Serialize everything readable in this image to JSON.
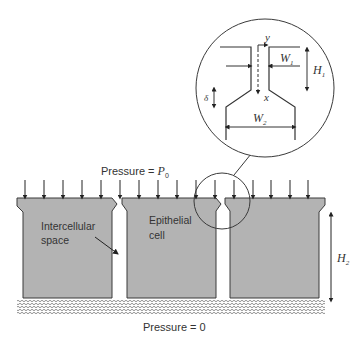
{
  "diagram": {
    "top_pressure": {
      "prefix": "Pressure = ",
      "symbol": "P",
      "subscript": "0"
    },
    "bottom_pressure": "Pressure = 0",
    "intercellular_label": [
      "Intercellular",
      "space"
    ],
    "epithelial_label": [
      "Epithelial",
      "cell"
    ],
    "h2_label": {
      "symbol": "H",
      "subscript": "2"
    },
    "inset": {
      "y_axis": "y",
      "x_axis": "x",
      "w1": {
        "symbol": "W",
        "subscript": "1"
      },
      "h1": {
        "symbol": "H",
        "subscript": "1"
      },
      "w2": {
        "symbol": "W",
        "subscript": "2"
      },
      "delta": "δ"
    },
    "colors": {
      "cell_fill": "#b3b3b3",
      "outline": "#3a3a3a",
      "text": "#333333"
    }
  }
}
